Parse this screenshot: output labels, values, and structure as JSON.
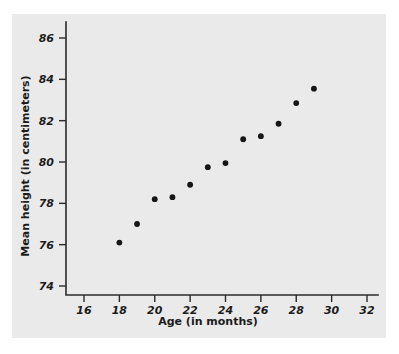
{
  "chart_data": {
    "type": "scatter",
    "title": "",
    "xlabel": "Age (in months)",
    "ylabel": "Mean height (in centimeters)",
    "xlim": [
      15,
      33
    ],
    "ylim": [
      73,
      87
    ],
    "xticks": [
      16,
      18,
      20,
      22,
      24,
      26,
      28,
      30,
      32
    ],
    "yticks": [
      74,
      76,
      78,
      80,
      82,
      84,
      86
    ],
    "xtick_labels": [
      "16",
      "18",
      "20",
      "22",
      "24",
      "26",
      "28",
      "30",
      "32"
    ],
    "ytick_labels": [
      "74",
      "76",
      "78",
      "80",
      "82",
      "84",
      "86"
    ],
    "grid": false,
    "legend": "none",
    "marker_color": "#161616",
    "background_color": "#e8e8e8",
    "axis_color": "#2b2b2b",
    "x": [
      18,
      19,
      20,
      21,
      22,
      23,
      24,
      25,
      26,
      27,
      28,
      29
    ],
    "y": [
      76.1,
      77.0,
      78.2,
      78.3,
      78.9,
      79.75,
      79.95,
      81.1,
      81.25,
      81.85,
      82.85,
      83.55
    ],
    "points": [
      {
        "x": 18,
        "y": 76.1
      },
      {
        "x": 19,
        "y": 77.0
      },
      {
        "x": 20,
        "y": 78.2
      },
      {
        "x": 21,
        "y": 78.3
      },
      {
        "x": 22,
        "y": 78.9
      },
      {
        "x": 23,
        "y": 79.75
      },
      {
        "x": 24,
        "y": 79.95
      },
      {
        "x": 25,
        "y": 81.1
      },
      {
        "x": 26,
        "y": 81.25
      },
      {
        "x": 27,
        "y": 81.85
      },
      {
        "x": 28,
        "y": 82.85
      },
      {
        "x": 29,
        "y": 83.55
      }
    ]
  }
}
